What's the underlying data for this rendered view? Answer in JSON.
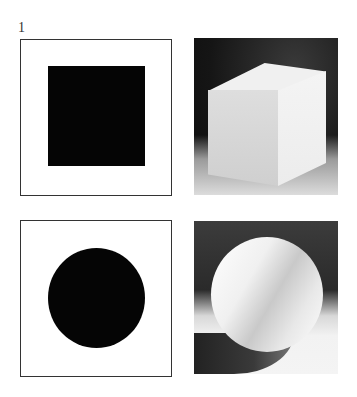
{
  "figure": {
    "number": "1",
    "panels": [
      {
        "id": "square-diagram",
        "type": "diagram",
        "shape": "square",
        "fill": "#050505"
      },
      {
        "id": "cube-photo",
        "type": "photo",
        "subject": "white cube on dark background"
      },
      {
        "id": "circle-diagram",
        "type": "diagram",
        "shape": "circle",
        "fill": "#050505"
      },
      {
        "id": "sphere-photo",
        "type": "photo",
        "subject": "white sphere with cast shadow"
      }
    ]
  }
}
